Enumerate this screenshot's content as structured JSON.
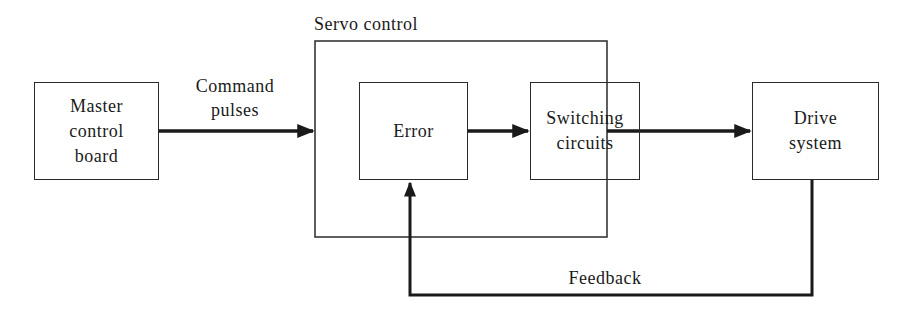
{
  "diagram": {
    "type": "block-diagram",
    "nodes": {
      "master": {
        "label_line1": "Master",
        "label_line2": "control",
        "label_line3": "board"
      },
      "servo_group": {
        "label": "Servo control"
      },
      "error": {
        "label": "Error"
      },
      "switching": {
        "label_line1": "Switching",
        "label_line2": "circuits"
      },
      "drive": {
        "label_line1": "Drive",
        "label_line2": "system"
      }
    },
    "edges": {
      "command": {
        "label_line1": "Command",
        "label_line2": "pulses",
        "from": "master",
        "to": "servo_group"
      },
      "error_to_switching": {
        "from": "error",
        "to": "switching"
      },
      "servo_to_drive": {
        "from": "servo_group",
        "to": "drive"
      },
      "feedback": {
        "label": "Feedback",
        "from": "drive",
        "to": "error"
      }
    },
    "colors": {
      "stroke": "#1a1a1a",
      "background": "#ffffff"
    }
  }
}
